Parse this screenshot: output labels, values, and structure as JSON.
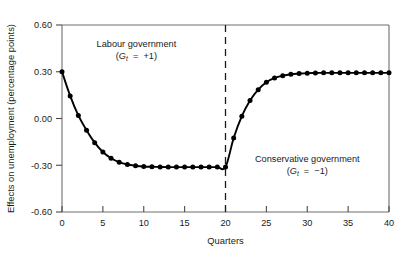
{
  "chart_data": {
    "type": "line",
    "title": "",
    "xlabel": "Quarters",
    "ylabel": "Effects on unemployment (percentage points)",
    "xlim": [
      0,
      40
    ],
    "ylim": [
      -0.6,
      0.6
    ],
    "grid": false,
    "legend": "none",
    "xticks": [
      "0",
      "5",
      "10",
      "15",
      "20",
      "25",
      "30",
      "35",
      "40"
    ],
    "xtick_values": [
      0,
      5,
      10,
      15,
      20,
      25,
      30,
      35,
      40
    ],
    "yticks": [
      "0.60",
      "0.30",
      "0.00",
      "-0.30",
      "-0.60"
    ],
    "ytick_values": [
      0.6,
      0.3,
      0.0,
      -0.3,
      -0.6
    ],
    "markers": "filled-circle",
    "series": [
      {
        "name": "Effect on unemployment",
        "x": [
          0,
          1,
          2,
          3,
          4,
          5,
          6,
          7,
          8,
          9,
          10,
          11,
          12,
          13,
          14,
          15,
          16,
          17,
          18,
          19,
          20,
          21,
          22,
          23,
          24,
          25,
          26,
          27,
          28,
          29,
          30,
          31,
          32,
          33,
          34,
          35,
          36,
          37,
          38,
          39,
          40
        ],
        "values": [
          0.3,
          0.145,
          0.02,
          -0.075,
          -0.155,
          -0.215,
          -0.255,
          -0.28,
          -0.295,
          -0.303,
          -0.308,
          -0.31,
          -0.311,
          -0.312,
          -0.312,
          -0.312,
          -0.312,
          -0.312,
          -0.312,
          -0.312,
          -0.312,
          -0.125,
          0.015,
          0.115,
          0.185,
          0.232,
          0.26,
          0.275,
          0.284,
          0.288,
          0.291,
          0.292,
          0.293,
          0.293,
          0.293,
          0.293,
          0.293,
          0.293,
          0.293,
          0.293,
          0.293
        ]
      }
    ],
    "annotations": [
      {
        "id": "labour",
        "line1": "Labour government",
        "var": "G",
        "subscript": "t",
        "relation": "=",
        "value": "+1",
        "x": 9.1,
        "y": 0.46
      },
      {
        "id": "conservative",
        "line1": "Conservative government",
        "var": "G",
        "subscript": "t",
        "relation": "=",
        "value": "−1",
        "x": 30.0,
        "y": -0.28
      }
    ],
    "vertical_divider": {
      "label": "regime change at quarter 20",
      "x": 20,
      "style": "dashed"
    }
  },
  "colors": {
    "line": "#000000",
    "marker": "#000000",
    "axis": "#6e6e6e",
    "text": "#1a1a1a",
    "background": "#ffffff"
  }
}
